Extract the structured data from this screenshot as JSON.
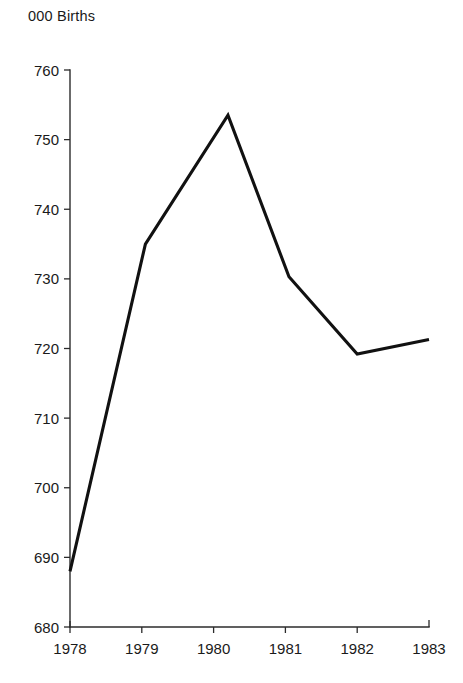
{
  "chart_data": {
    "type": "line",
    "title": "000 Births",
    "xlabel": "",
    "ylabel": "",
    "ylim": [
      680,
      760
    ],
    "xlim": [
      1978,
      1983
    ],
    "grid": false,
    "legend": null,
    "yticks": [
      680,
      690,
      700,
      710,
      720,
      730,
      740,
      750,
      760
    ],
    "ytick_labels": [
      "680",
      "690",
      "700",
      "710",
      "720",
      "730",
      "740",
      "750",
      "760"
    ],
    "xticks": [
      1978,
      1979,
      1980,
      1981,
      1982,
      1983
    ],
    "xtick_labels": [
      "1978",
      "1979",
      "1980",
      "1981",
      "1982",
      "1983"
    ],
    "series": [
      {
        "name": "Births",
        "color": "#111111",
        "x": [
          1978,
          1979.05,
          1980.2,
          1981.05,
          1982.0,
          1983.0
        ],
        "values": [
          688.0,
          735.0,
          753.5,
          730.3,
          719.2,
          721.3
        ]
      }
    ]
  },
  "axes": {
    "title_text": "000 Births"
  }
}
